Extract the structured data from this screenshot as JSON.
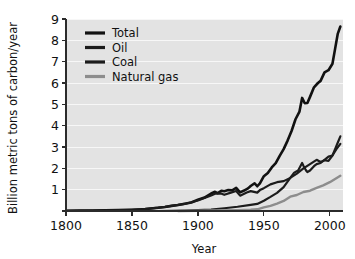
{
  "chart_data": {
    "type": "line",
    "title": "",
    "xlabel": "Year",
    "ylabel": "Billion metric tons of carbon/year",
    "xlim": [
      1800,
      2010
    ],
    "ylim": [
      0,
      9
    ],
    "grid": true,
    "legend_position": "top-left",
    "x_ticks": [
      1800,
      1850,
      1900,
      1950,
      2000
    ],
    "x_tick_labels": [
      "1800",
      "1850",
      "1900",
      "1950",
      "2000"
    ],
    "y_ticks": [
      0,
      1,
      2,
      3,
      4,
      5,
      6,
      7,
      8,
      9
    ],
    "y_tick_labels": [
      "",
      "1",
      "2",
      "3",
      "4",
      "5",
      "6",
      "7",
      "8",
      "9"
    ],
    "colors": {
      "total": "#111111",
      "oil": "#1c1c1c",
      "coal": "#1c1c1c",
      "natural_gas": "#8d8d8d",
      "plot_background": "#e3e3e3",
      "gridline": "#f7f7f7",
      "axis": "#2b2b2b"
    },
    "series": [
      {
        "name": "Total",
        "color": "#111111",
        "width": 2.6,
        "x": [
          1800,
          1810,
          1820,
          1830,
          1840,
          1850,
          1860,
          1870,
          1875,
          1880,
          1885,
          1890,
          1895,
          1900,
          1905,
          1910,
          1913,
          1915,
          1918,
          1920,
          1923,
          1926,
          1929,
          1932,
          1935,
          1938,
          1940,
          1943,
          1945,
          1947,
          1950,
          1953,
          1956,
          1959,
          1962,
          1965,
          1968,
          1971,
          1974,
          1977,
          1979,
          1981,
          1983,
          1985,
          1988,
          1991,
          1993,
          1996,
          1999,
          2002,
          2004,
          2006,
          2008
        ],
        "values": [
          0.01,
          0.02,
          0.02,
          0.03,
          0.04,
          0.05,
          0.09,
          0.15,
          0.19,
          0.24,
          0.28,
          0.34,
          0.4,
          0.53,
          0.63,
          0.82,
          0.9,
          0.84,
          0.95,
          0.93,
          0.98,
          0.97,
          1.08,
          0.87,
          0.96,
          1.06,
          1.17,
          1.3,
          1.16,
          1.3,
          1.63,
          1.78,
          2.04,
          2.24,
          2.58,
          2.9,
          3.3,
          3.75,
          4.3,
          4.66,
          5.3,
          5.05,
          5.06,
          5.35,
          5.8,
          6.0,
          6.1,
          6.5,
          6.6,
          6.9,
          7.6,
          8.3,
          8.65
        ]
      },
      {
        "name": "Oil",
        "color": "#1c1c1c",
        "width": 2.2,
        "x": [
          1870,
          1880,
          1890,
          1900,
          1910,
          1920,
          1930,
          1940,
          1945,
          1950,
          1955,
          1960,
          1965,
          1970,
          1973,
          1976,
          1979,
          1980,
          1982,
          1983,
          1985,
          1988,
          1990,
          1993,
          1996,
          1999,
          2002,
          2005,
          2008
        ],
        "values": [
          0.0,
          0.01,
          0.02,
          0.04,
          0.07,
          0.13,
          0.2,
          0.29,
          0.33,
          0.48,
          0.66,
          0.85,
          1.12,
          1.55,
          1.8,
          1.9,
          2.25,
          2.12,
          1.9,
          1.82,
          1.9,
          2.1,
          2.2,
          2.25,
          2.4,
          2.55,
          2.6,
          2.9,
          3.15
        ]
      },
      {
        "name": "Coal",
        "color": "#1c1c1c",
        "width": 2.2,
        "x": [
          1800,
          1820,
          1840,
          1860,
          1875,
          1890,
          1900,
          1910,
          1913,
          1918,
          1920,
          1925,
          1929,
          1932,
          1937,
          1940,
          1945,
          1947,
          1950,
          1955,
          1960,
          1965,
          1970,
          1975,
          1980,
          1985,
          1990,
          1993,
          1996,
          1999,
          2002,
          2004,
          2006,
          2008
        ],
        "values": [
          0.01,
          0.02,
          0.04,
          0.09,
          0.19,
          0.33,
          0.49,
          0.73,
          0.81,
          0.81,
          0.76,
          0.86,
          0.94,
          0.72,
          0.87,
          0.93,
          0.86,
          0.98,
          1.07,
          1.25,
          1.35,
          1.4,
          1.55,
          1.75,
          2.0,
          2.2,
          2.4,
          2.3,
          2.38,
          2.35,
          2.6,
          2.9,
          3.2,
          3.5
        ]
      },
      {
        "name": "Natural gas",
        "color": "#8d8d8d",
        "width": 2.4,
        "x": [
          1885,
          1900,
          1915,
          1930,
          1940,
          1945,
          1950,
          1955,
          1960,
          1965,
          1970,
          1975,
          1980,
          1985,
          1990,
          1995,
          2000,
          2004,
          2008
        ],
        "values": [
          0.0,
          0.01,
          0.02,
          0.04,
          0.06,
          0.08,
          0.17,
          0.24,
          0.35,
          0.47,
          0.67,
          0.75,
          0.89,
          0.95,
          1.08,
          1.2,
          1.35,
          1.5,
          1.65
        ]
      }
    ]
  },
  "legend": {
    "items": [
      {
        "label": "Total"
      },
      {
        "label": "Oil"
      },
      {
        "label": "Coal"
      },
      {
        "label": "Natural gas"
      }
    ]
  }
}
